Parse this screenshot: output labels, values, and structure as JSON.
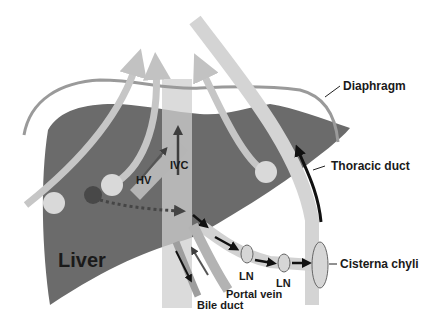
{
  "diagram": {
    "labels": {
      "diaphragm": "Diaphragm",
      "thoracic_duct": "Thoracic duct",
      "cisterna_chyli": "Cisterna chyli",
      "liver": "Liver",
      "hv": "HV",
      "ivc": "IVC",
      "ln1": "LN",
      "ln2": "LN",
      "portal_vein": "Portal vein",
      "bile_duct": "Bile duct"
    },
    "colors": {
      "liver": "#6b6b6b",
      "liver_dark": "#5a5a5a",
      "diaphragm": "#9a9a9a",
      "pathway": "#c9c9c9",
      "ivc_band": "#cfcfcf",
      "node_fill": "#d6d6d6",
      "arrow_black": "#111111",
      "dark_spot": "#4a4a4a"
    }
  }
}
